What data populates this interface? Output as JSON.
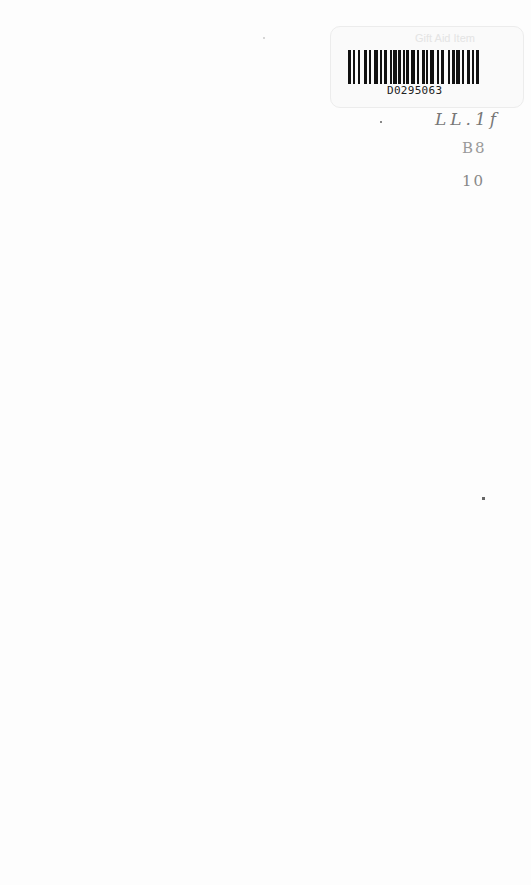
{
  "sticker": {
    "label": "Gift Aid Item",
    "barcode_number": "D0295063"
  },
  "handwriting": {
    "line1": "LL.1f",
    "line2": "B8",
    "line3": "10"
  },
  "colors": {
    "page_background": "#fdfdfd",
    "barcode_ink": "#111111",
    "pencil": "#777777"
  }
}
